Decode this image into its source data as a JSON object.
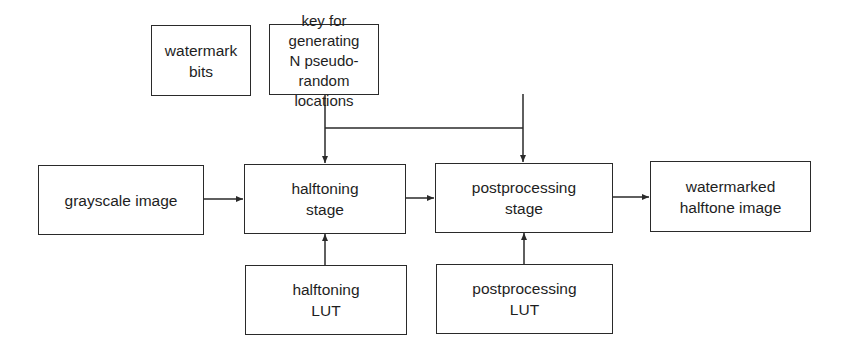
{
  "diagram": {
    "nodes": [
      {
        "id": "watermark_bits",
        "label": "watermark bits"
      },
      {
        "id": "key",
        "label": "key for generating\nN pseudo-random\nlocations"
      },
      {
        "id": "grayscale_image",
        "label": "grayscale image"
      },
      {
        "id": "halftoning_stage",
        "label": "halftoning\nstage"
      },
      {
        "id": "postprocessing_stage",
        "label": "postprocessing\nstage"
      },
      {
        "id": "watermarked_halftone",
        "label": "watermarked\nhalftone image"
      },
      {
        "id": "halftoning_lut",
        "label": "halftoning\nLUT"
      },
      {
        "id": "postprocessing_lut",
        "label": "postprocessing\nLUT"
      }
    ],
    "edges": [
      {
        "from": "grayscale_image",
        "to": "halftoning_stage"
      },
      {
        "from": "halftoning_stage",
        "to": "postprocessing_stage"
      },
      {
        "from": "postprocessing_stage",
        "to": "watermarked_halftone"
      },
      {
        "from": "halftoning_lut",
        "to": "halftoning_stage"
      },
      {
        "from": "postprocessing_lut",
        "to": "postprocessing_stage"
      },
      {
        "from": "watermark_bits",
        "to": "halftoning_stage"
      },
      {
        "from": "watermark_bits",
        "to": "postprocessing_stage"
      },
      {
        "from": "key",
        "to": "halftoning_stage"
      },
      {
        "from": "key",
        "to": "postprocessing_stage"
      }
    ],
    "colors": {
      "line": "#2a2a2a",
      "text": "#1e1e1e",
      "background": "#ffffff"
    }
  }
}
